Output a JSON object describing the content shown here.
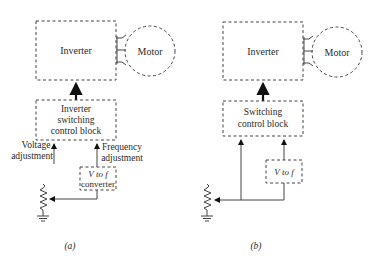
{
  "figure": {
    "panels": [
      {
        "id": "a",
        "caption": "(a)",
        "inverter_label": "Inverter",
        "motor_label": "Motor",
        "control_block_lines": [
          "Inverter",
          "switching",
          "control block"
        ],
        "voltage_label_lines": [
          "Voltage",
          "adjustment"
        ],
        "frequency_label_lines": [
          "Frequency",
          "adjustment"
        ],
        "converter_lines": [
          "V to f",
          "converter"
        ]
      },
      {
        "id": "b",
        "caption": "(b)",
        "inverter_label": "Inverter",
        "motor_label": "Motor",
        "control_block_lines": [
          "Switching",
          "control block"
        ],
        "converter_lines": [
          "V to f"
        ]
      }
    ]
  }
}
